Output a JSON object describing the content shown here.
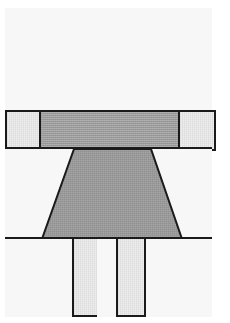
{
  "figure": {
    "canvas": {
      "width": 230,
      "height": 323,
      "background": "#ffffff"
    },
    "frame": {
      "x": 5,
      "y": 8,
      "width": 207,
      "height": 305,
      "stroke": "#1a1a1a",
      "stroke_width": 2,
      "fill": "#f7f7f7"
    },
    "palette": {
      "outline": "#1a1a1a",
      "page": "#ffffff",
      "fill_white": "#f7f7f7",
      "fill_light": "#e8e8e8",
      "fill_mid": "#9a9a9a"
    },
    "bands": [
      {
        "name": "upper-blank-band",
        "label": "Band 1",
        "y": 8,
        "height": 102,
        "fill": "#f7f7f7"
      },
      {
        "name": "slab-band",
        "label": "Band 2",
        "y": 110,
        "height": 37,
        "fill": "#f7f7f7"
      },
      {
        "name": "pedestal-band",
        "label": "Band 3",
        "y": 147,
        "height": 90,
        "fill": "#f7f7f7"
      },
      {
        "name": "legs-band",
        "label": "Band 4",
        "y": 237,
        "height": 76,
        "fill": "#f7f7f7"
      }
    ],
    "shapes": [
      {
        "name": "left-shoulder-block",
        "band": "slab-band",
        "fill": "#e8e8e8",
        "x": 5,
        "y": 110,
        "width": 34,
        "height": 37
      },
      {
        "name": "center-slab",
        "band": "slab-band",
        "fill": "#9a9a9a",
        "x": 39,
        "y": 110,
        "width": 139,
        "height": 37
      },
      {
        "name": "right-shoulder-block",
        "band": "slab-band",
        "fill": "#e8e8e8",
        "x": 178,
        "y": 110,
        "width": 34,
        "height": 37
      },
      {
        "name": "pedestal-trapezoid",
        "band": "pedestal-band",
        "fill": "#9a9a9a",
        "points": "72,147 149,147 180,237 40,237",
        "top_left_x": 72,
        "top_right_x": 149,
        "bottom_left_x": 40,
        "bottom_right_x": 180,
        "top_y": 147,
        "bottom_y": 237
      },
      {
        "name": "left-leg",
        "band": "legs-band",
        "fill": "#e8e8e8",
        "x": 72,
        "y": 237,
        "width": 25,
        "height": 76
      },
      {
        "name": "center-gap",
        "band": "legs-band",
        "fill": "#f7f7f7",
        "x": 97,
        "y": 237,
        "width": 19,
        "height": 76
      },
      {
        "name": "right-leg",
        "band": "legs-band",
        "fill": "#e8e8e8",
        "x": 116,
        "y": 237,
        "width": 26,
        "height": 76
      }
    ],
    "dividers": [
      {
        "name": "divider-1",
        "y": 110
      },
      {
        "name": "divider-2",
        "y": 147
      },
      {
        "name": "divider-3",
        "y": 237
      }
    ]
  }
}
